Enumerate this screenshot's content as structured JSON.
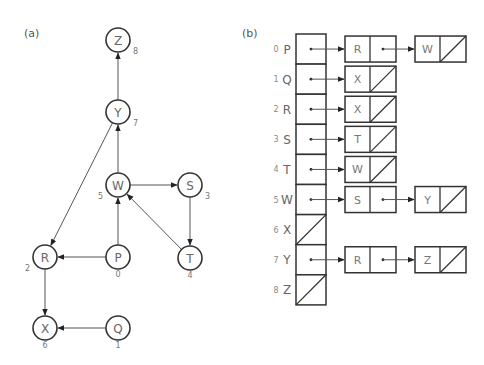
{
  "panels": {
    "a": {
      "label": "(a)"
    },
    "b": {
      "label": "(b)"
    }
  },
  "graph": {
    "nodes": [
      {
        "id": "Z",
        "index": "8",
        "x": 118,
        "y": 40,
        "idx_pos": "br"
      },
      {
        "id": "Y",
        "index": "7",
        "x": 118,
        "y": 112,
        "idx_pos": "br"
      },
      {
        "id": "W",
        "index": "5",
        "x": 118,
        "y": 185,
        "idx_pos": "bl"
      },
      {
        "id": "S",
        "index": "3",
        "x": 190,
        "y": 185,
        "idx_pos": "br"
      },
      {
        "id": "R",
        "index": "2",
        "x": 45,
        "y": 257,
        "idx_pos": "bl"
      },
      {
        "id": "P",
        "index": "0",
        "x": 118,
        "y": 257,
        "idx_pos": "b"
      },
      {
        "id": "T",
        "index": "4",
        "x": 190,
        "y": 258,
        "idx_pos": "b"
      },
      {
        "id": "X",
        "index": "6",
        "x": 45,
        "y": 328,
        "idx_pos": "b"
      },
      {
        "id": "Q",
        "index": "1",
        "x": 118,
        "y": 328,
        "idx_pos": "b"
      }
    ],
    "edges": [
      {
        "from": "Y",
        "to": "Z"
      },
      {
        "from": "W",
        "to": "Y"
      },
      {
        "from": "Y",
        "to": "R"
      },
      {
        "from": "W",
        "to": "S"
      },
      {
        "from": "S",
        "to": "T"
      },
      {
        "from": "T",
        "to": "W"
      },
      {
        "from": "P",
        "to": "W"
      },
      {
        "from": "P",
        "to": "R"
      },
      {
        "from": "R",
        "to": "X"
      },
      {
        "from": "Q",
        "to": "X"
      }
    ]
  },
  "adjacency_list": {
    "rows": [
      {
        "index": "0",
        "vertex": "P",
        "list": [
          "R",
          "W"
        ]
      },
      {
        "index": "1",
        "vertex": "Q",
        "list": [
          "X"
        ]
      },
      {
        "index": "2",
        "vertex": "R",
        "list": [
          "X"
        ]
      },
      {
        "index": "3",
        "vertex": "S",
        "list": [
          "T"
        ]
      },
      {
        "index": "4",
        "vertex": "T",
        "list": [
          "W"
        ]
      },
      {
        "index": "5",
        "vertex": "W",
        "list": [
          "S",
          "Y"
        ]
      },
      {
        "index": "6",
        "vertex": "X",
        "list": []
      },
      {
        "index": "7",
        "vertex": "Y",
        "list": [
          "R",
          "Z"
        ]
      },
      {
        "index": "8",
        "vertex": "Z",
        "list": []
      }
    ]
  },
  "colors": {
    "stroke": "#333333",
    "edge": "#555555",
    "text": "#666666"
  }
}
